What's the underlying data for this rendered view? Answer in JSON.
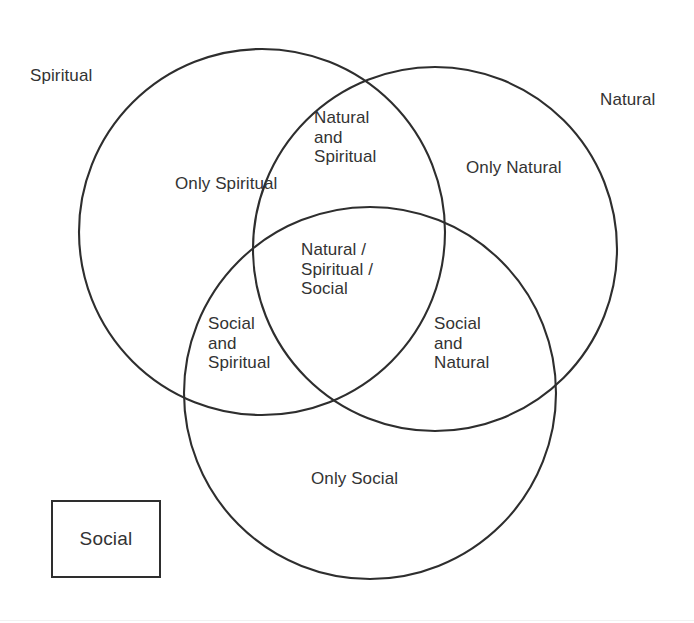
{
  "diagram": {
    "type": "venn",
    "set_count": 3,
    "stroke_color": "#2e2e2e",
    "background_color": "#ffffff",
    "text_color": "#333333",
    "sets": [
      {
        "key": "spiritual",
        "outer_label": "Spiritual",
        "cx": 262,
        "cy": 232,
        "r": 183
      },
      {
        "key": "natural",
        "outer_label": "Natural",
        "cx": 435,
        "cy": 249,
        "r": 182
      },
      {
        "key": "social",
        "outer_label": "Social",
        "cx": 370,
        "cy": 393,
        "r": 186
      }
    ],
    "regions": [
      {
        "key": "only_spiritual",
        "label": "Only Spiritual"
      },
      {
        "key": "natural_and_spiritual",
        "label": "Natural\nand\nSpiritual"
      },
      {
        "key": "only_natural",
        "label": "Only Natural"
      },
      {
        "key": "all_three",
        "label": "Natural /\nSpiritual /\nSocial"
      },
      {
        "key": "social_and_spiritual",
        "label": "Social\nand\nSpiritual"
      },
      {
        "key": "social_and_natural",
        "label": "Social\nand\nNatural"
      },
      {
        "key": "only_social",
        "label": "Only Social"
      }
    ],
    "legend_box": {
      "label": "Social"
    }
  }
}
